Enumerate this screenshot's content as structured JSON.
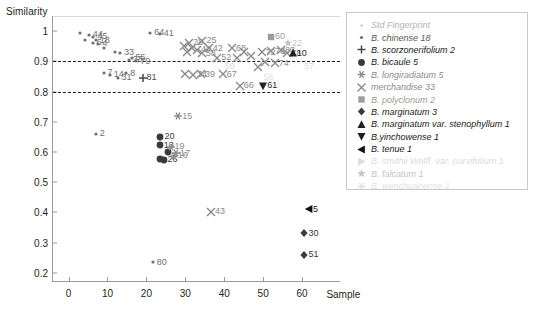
{
  "chart_data": {
    "type": "scatter",
    "title": "",
    "ylabel": "Similarity",
    "xlabel": "Sample",
    "xlim": [
      -4,
      70
    ],
    "ylim": [
      0.17,
      1.05
    ],
    "xticks": [
      0,
      10,
      20,
      30,
      40,
      50,
      60
    ],
    "yticks": [
      "0.2",
      "0.3",
      "0.4",
      "0.5",
      "0.6",
      "0.7",
      "0.8",
      "0.9",
      "1"
    ],
    "grid": false,
    "legend_position": "right",
    "reference_lines": [
      {
        "y": 0.9,
        "style": "dashed",
        "color": "#1a1a1a"
      },
      {
        "y": 0.8,
        "style": "dashed",
        "color": "#1a1a1a"
      }
    ],
    "series": [
      {
        "name": "Std Fingerprint",
        "count": "",
        "marker": "tiny-dot",
        "color": "#b3b3b3",
        "points": []
      },
      {
        "name": "B. chinense",
        "count": "18",
        "marker": "dot",
        "color": "#6f6f6f",
        "points": [
          {
            "x": 3.0,
            "y": 0.995,
            "label": ""
          },
          {
            "x": 5.2,
            "y": 0.988,
            "label": "44"
          },
          {
            "x": 6.4,
            "y": 0.982,
            "label": "45"
          },
          {
            "x": 4.2,
            "y": 0.972,
            "label": ""
          },
          {
            "x": 7.0,
            "y": 0.97,
            "label": "18"
          },
          {
            "x": 6.2,
            "y": 0.962,
            "label": "6"
          },
          {
            "x": 7.6,
            "y": 0.958,
            "label": "4"
          },
          {
            "x": 9.2,
            "y": 0.945,
            "label": ""
          },
          {
            "x": 12.0,
            "y": 0.93,
            "label": ""
          },
          {
            "x": 13.2,
            "y": 0.928,
            "label": "33"
          },
          {
            "x": 16.2,
            "y": 0.912,
            "label": "55"
          },
          {
            "x": 15.4,
            "y": 0.906,
            "label": "23"
          },
          {
            "x": 17.4,
            "y": 0.9,
            "label": "79"
          },
          {
            "x": 21.0,
            "y": 0.995,
            "label": "64"
          },
          {
            "x": 23.4,
            "y": 0.992,
            "label": "41"
          },
          {
            "x": 9.0,
            "y": 0.862,
            "label": "7"
          },
          {
            "x": 10.6,
            "y": 0.855,
            "label": "14"
          },
          {
            "x": 12.6,
            "y": 0.846,
            "label": "31"
          },
          {
            "x": 14.8,
            "y": 0.86,
            "label": "8"
          },
          {
            "x": 7.0,
            "y": 0.66,
            "label": "2"
          },
          {
            "x": 21.6,
            "y": 0.235,
            "label": "80"
          }
        ]
      },
      {
        "name": "B. scorzonerifolium",
        "count": "2",
        "marker": "plus",
        "color": "#4a4a4a",
        "points": [
          {
            "x": 19.0,
            "y": 0.845,
            "label": "81"
          }
        ]
      },
      {
        "name": "B. bicaule",
        "count": "5",
        "marker": "circle",
        "color": "#3a3a3a",
        "points": [
          {
            "x": 23.6,
            "y": 0.65,
            "label": "20"
          },
          {
            "x": 23.4,
            "y": 0.622,
            "label": "13"
          },
          {
            "x": 25.6,
            "y": 0.6,
            "label": ""
          },
          {
            "x": 23.4,
            "y": 0.578,
            "label": ""
          },
          {
            "x": 24.4,
            "y": 0.574,
            "label": "26"
          }
        ]
      },
      {
        "name": "B. longiradiatum",
        "count": "5",
        "marker": "asterisk",
        "color": "#8c8c8c",
        "points": [
          {
            "x": 28.2,
            "y": 0.718,
            "label": "15"
          },
          {
            "x": 26.2,
            "y": 0.618,
            "label": "19"
          },
          {
            "x": 27.6,
            "y": 0.596,
            "label": "17"
          },
          {
            "x": 27.0,
            "y": 0.588,
            "label": "16"
          }
        ]
      },
      {
        "name": "merchandise",
        "count": "33",
        "marker": "cross",
        "color": "#8a8a8a",
        "points": [
          {
            "x": 31.0,
            "y": 0.962,
            "label": "38"
          },
          {
            "x": 34.4,
            "y": 0.968,
            "label": "25"
          },
          {
            "x": 29.6,
            "y": 0.95,
            "label": ""
          },
          {
            "x": 31.8,
            "y": 0.944,
            "label": ""
          },
          {
            "x": 33.0,
            "y": 0.938,
            "label": "40"
          },
          {
            "x": 36.0,
            "y": 0.944,
            "label": "42"
          },
          {
            "x": 30.4,
            "y": 0.93,
            "label": ""
          },
          {
            "x": 34.2,
            "y": 0.926,
            "label": "58"
          },
          {
            "x": 42.0,
            "y": 0.944,
            "label": "68"
          },
          {
            "x": 45.0,
            "y": 0.93,
            "label": ""
          },
          {
            "x": 38.2,
            "y": 0.912,
            "label": "52"
          },
          {
            "x": 43.2,
            "y": 0.91,
            "label": ""
          },
          {
            "x": 47.0,
            "y": 0.918,
            "label": ""
          },
          {
            "x": 49.6,
            "y": 0.93,
            "label": "72"
          },
          {
            "x": 52.0,
            "y": 0.934,
            "label": "76"
          },
          {
            "x": 54.6,
            "y": 0.936,
            "label": "83"
          },
          {
            "x": 56.2,
            "y": 0.926,
            "label": "78"
          },
          {
            "x": 50.4,
            "y": 0.898,
            "label": ""
          },
          {
            "x": 53.0,
            "y": 0.894,
            "label": "74"
          },
          {
            "x": 48.8,
            "y": 0.882,
            "label": ""
          },
          {
            "x": 30.0,
            "y": 0.858,
            "label": ""
          },
          {
            "x": 32.0,
            "y": 0.856,
            "label": "34"
          },
          {
            "x": 34.0,
            "y": 0.858,
            "label": "39"
          },
          {
            "x": 39.6,
            "y": 0.858,
            "label": "67"
          },
          {
            "x": 44.0,
            "y": 0.82,
            "label": "66"
          },
          {
            "x": 36.6,
            "y": 0.402,
            "label": "43"
          }
        ]
      },
      {
        "name": "B. polyclonum",
        "count": "2",
        "marker": "square",
        "color": "#9c9c9c",
        "points": [
          {
            "x": 52.0,
            "y": 0.982,
            "label": "60"
          }
        ]
      },
      {
        "name": "B. marginatum",
        "count": "3",
        "marker": "diamond",
        "color": "#3a3a3a",
        "points": [
          {
            "x": 60.6,
            "y": 0.332,
            "label": "30"
          },
          {
            "x": 60.6,
            "y": 0.26,
            "label": "51"
          }
        ]
      },
      {
        "name": "B. marginatum var. stenophyllum",
        "count": "1",
        "marker": "triangle-up",
        "color": "#1f1f1f",
        "points": [
          {
            "x": 57.6,
            "y": 0.926,
            "label": "10"
          }
        ]
      },
      {
        "name": "B.yinchowense",
        "count": "1",
        "marker": "triangle-down",
        "color": "#1f1f1f",
        "points": [
          {
            "x": 50.0,
            "y": 0.82,
            "label": "61"
          }
        ]
      },
      {
        "name": "B. tenue",
        "count": "1",
        "marker": "triangle-left",
        "color": "#111111",
        "points": [
          {
            "x": 61.8,
            "y": 0.41,
            "label": "5"
          }
        ]
      },
      {
        "name": "B. smithii Wolff. var. parvifolium",
        "count": "1",
        "marker": "triangle-right",
        "color": "#dcdcdc",
        "points": []
      },
      {
        "name": "B. falcatum",
        "count": "1",
        "marker": "star",
        "color": "#c4c4c4",
        "points": [
          {
            "x": 56.4,
            "y": 0.96,
            "label": "22"
          }
        ]
      },
      {
        "name": "B. wenchuanense",
        "count": "1",
        "marker": "asterisk",
        "color": "#e2e2e2",
        "points": []
      }
    ],
    "faint_labels": [
      {
        "x": 41.4,
        "y": 0.886,
        "text": "59",
        "color": "#dadada"
      },
      {
        "x": 61.8,
        "y": 0.886,
        "text": "57",
        "color": "#dadada"
      },
      {
        "x": 51.4,
        "y": 0.848,
        "text": "56",
        "color": "#e0e0e0"
      }
    ]
  },
  "legend": {
    "items": [
      {
        "marker": "tiny-dot",
        "color": "#b3b3b3",
        "label": "Std Fingerprint",
        "count": ""
      },
      {
        "marker": "dot",
        "color": "#6f6f6f",
        "label": "B. chinense",
        "count": "18"
      },
      {
        "marker": "plus",
        "color": "#4a4a4a",
        "label": "B. scorzonerifolium",
        "count": "2"
      },
      {
        "marker": "circle",
        "color": "#3a3a3a",
        "label": "B. bicaule",
        "count": "5"
      },
      {
        "marker": "asterisk",
        "color": "#8c8c8c",
        "label": "B. longiradiatum",
        "count": "5"
      },
      {
        "marker": "cross",
        "color": "#8a8a8a",
        "label": "merchandise",
        "count": "33"
      },
      {
        "marker": "square",
        "color": "#9c9c9c",
        "label": "B. polyclonum",
        "count": "2"
      },
      {
        "marker": "diamond",
        "color": "#3a3a3a",
        "label": "B. marginatum",
        "count": "3"
      },
      {
        "marker": "triangle-up",
        "color": "#1f1f1f",
        "label": "B. marginatum var. stenophyllum",
        "count": "1"
      },
      {
        "marker": "triangle-down",
        "color": "#1f1f1f",
        "label": "B.yinchowense",
        "count": "1"
      },
      {
        "marker": "triangle-left",
        "color": "#111111",
        "label": "B. tenue",
        "count": "1"
      },
      {
        "marker": "triangle-right",
        "color": "#dcdcdc",
        "label": "B. smithii Wolff. var. parvifolium",
        "count": "1"
      },
      {
        "marker": "star",
        "color": "#c4c4c4",
        "label": "B. falcatum",
        "count": "1"
      },
      {
        "marker": "asterisk",
        "color": "#e2e2e2",
        "label": "B. wenchuanense",
        "count": "1"
      }
    ]
  }
}
